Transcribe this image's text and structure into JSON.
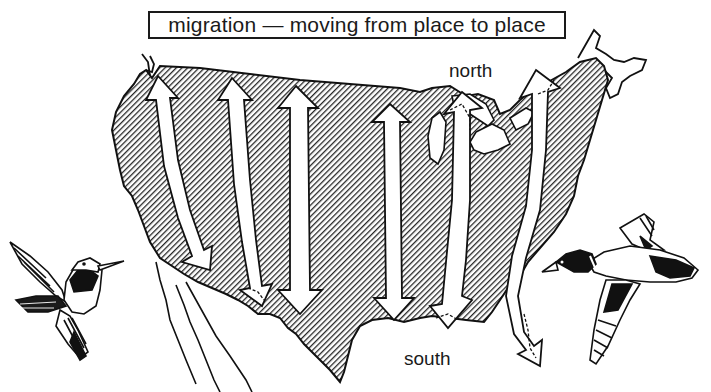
{
  "diagram": {
    "title": "migration — moving from place to place",
    "labels": {
      "north": "north",
      "south": "south"
    },
    "map": {
      "region": "united-states",
      "fill_pattern": "diagonal-hatch",
      "fill_color": "#2a2a2a",
      "outline_color": "#111111"
    },
    "arrows": [
      {
        "id": "pacific-flyway-west",
        "direction": "bidirectional",
        "style": "white-solid"
      },
      {
        "id": "pacific-flyway-east",
        "direction": "bidirectional",
        "style": "white-solid"
      },
      {
        "id": "central-flyway",
        "direction": "bidirectional",
        "style": "white-solid"
      },
      {
        "id": "mississippi-flyway",
        "direction": "bidirectional",
        "style": "white-solid"
      },
      {
        "id": "great-lakes-route",
        "direction": "bidirectional",
        "style": "white-dashed-tips"
      },
      {
        "id": "atlantic-flyway",
        "direction": "bidirectional",
        "style": "white-dashed-tips"
      }
    ],
    "illustrations": [
      {
        "id": "hummingbird",
        "position": "bottom-left"
      },
      {
        "id": "mallard-duck",
        "position": "bottom-right"
      }
    ]
  }
}
